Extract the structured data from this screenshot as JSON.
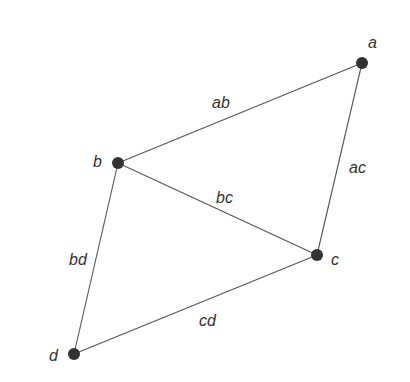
{
  "graph": {
    "nodes": [
      {
        "id": "a",
        "label": "a",
        "x": 362,
        "y": 63,
        "lx": 368,
        "ly": 48
      },
      {
        "id": "b",
        "label": "b",
        "x": 118,
        "y": 163,
        "lx": 93,
        "ly": 167
      },
      {
        "id": "c",
        "label": "c",
        "x": 317,
        "y": 255,
        "lx": 331,
        "ly": 265
      },
      {
        "id": "d",
        "label": "d",
        "x": 74,
        "y": 354,
        "lx": 49,
        "ly": 361
      }
    ],
    "edges": [
      {
        "id": "ab",
        "from": "a",
        "to": "b",
        "label": "ab",
        "lx": 212,
        "ly": 108
      },
      {
        "id": "ac",
        "from": "a",
        "to": "c",
        "label": "ac",
        "lx": 349,
        "ly": 173
      },
      {
        "id": "bc",
        "from": "b",
        "to": "c",
        "label": "bc",
        "lx": 216,
        "ly": 203
      },
      {
        "id": "bd",
        "from": "b",
        "to": "d",
        "label": "bd",
        "lx": 69,
        "ly": 265
      },
      {
        "id": "cd",
        "from": "c",
        "to": "d",
        "label": "cd",
        "lx": 199,
        "ly": 326
      }
    ],
    "colors": {
      "node": "#333333",
      "edge": "#555555",
      "text": "#333333"
    }
  }
}
